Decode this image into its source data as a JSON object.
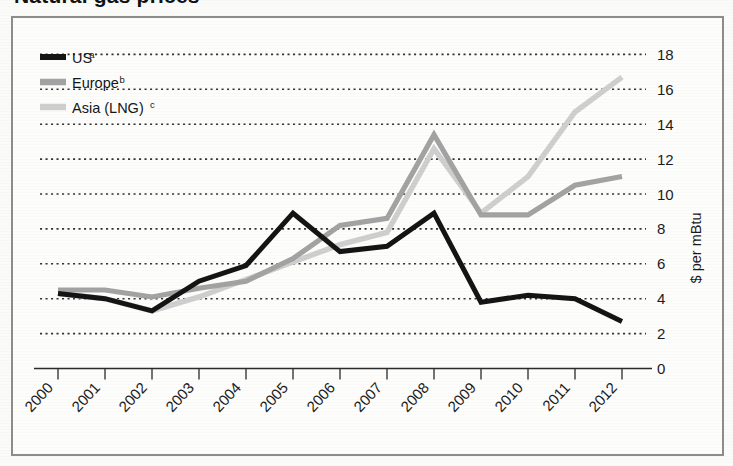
{
  "figure": {
    "title_partial": "Natural gas prices",
    "frame_color": "#8d8d8d",
    "background": "#fdfdfc"
  },
  "legend": {
    "position": "top-left",
    "items": [
      {
        "label": "US",
        "superscript": "a",
        "color": "#141414",
        "name": "us"
      },
      {
        "label": "Europe",
        "superscript": "b",
        "color": "#a3a3a3",
        "name": "europe"
      },
      {
        "label": "Asia (LNG)",
        "superscript": "c",
        "color": "#cfcfcf",
        "name": "asia-lng"
      }
    ]
  },
  "axis": {
    "y_title": "$ per mBtu",
    "y_ticks": [
      "0",
      "2",
      "4",
      "6",
      "8",
      "10",
      "12",
      "14",
      "16",
      "18"
    ],
    "x_ticks": [
      "2000",
      "2001",
      "2002",
      "2003",
      "2004",
      "2005",
      "2006",
      "2007",
      "2008",
      "2009",
      "2010",
      "2011",
      "2012"
    ]
  },
  "chart_data": {
    "type": "line",
    "title": "Natural gas prices",
    "xlabel": "",
    "ylabel": "$ per mBtu",
    "ylim": [
      0,
      18
    ],
    "grid": true,
    "legend_position": "top-left",
    "x": [
      "2000",
      "2001",
      "2002",
      "2003",
      "2004",
      "2005",
      "2006",
      "2007",
      "2008",
      "2009",
      "2010",
      "2011",
      "2012"
    ],
    "series": [
      {
        "name": "US",
        "note": "a",
        "color": "#141414",
        "values": [
          4.3,
          4.0,
          3.3,
          5.0,
          5.9,
          8.9,
          6.7,
          7.0,
          8.9,
          3.8,
          4.2,
          4.0,
          2.7
        ]
      },
      {
        "name": "Europe",
        "note": "b",
        "color": "#a3a3a3",
        "values": [
          4.5,
          4.5,
          4.1,
          4.6,
          5.0,
          6.3,
          8.2,
          8.6,
          13.4,
          8.8,
          8.8,
          10.5,
          11.0
        ]
      },
      {
        "name": "Asia (LNG)",
        "note": "c",
        "color": "#cfcfcf",
        "values": [
          4.3,
          4.0,
          3.3,
          4.1,
          5.1,
          6.1,
          7.1,
          7.8,
          12.6,
          8.9,
          11.0,
          14.7,
          16.7
        ]
      }
    ]
  }
}
